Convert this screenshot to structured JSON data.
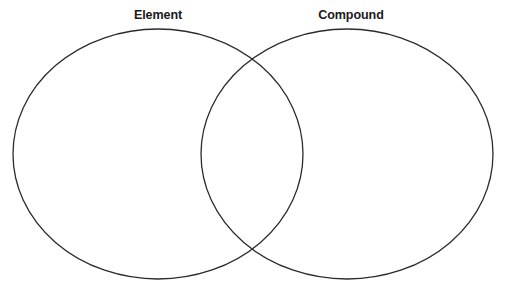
{
  "diagram": {
    "type": "venn-diagram",
    "title": "",
    "background_color": "#ffffff",
    "stroke_color": "#2b2b2b",
    "stroke_width": 1.3,
    "fill": "none",
    "sets": [
      {
        "id": "left",
        "label": "Element",
        "shape": "ellipse",
        "cx": 158,
        "cy": 154,
        "rx": 145,
        "ry": 125
      },
      {
        "id": "right",
        "label": "Compound",
        "shape": "ellipse",
        "cx": 347,
        "cy": 154,
        "rx": 146,
        "ry": 125
      }
    ],
    "intersection": {
      "label": "",
      "upper_point": [
        255,
        63
      ],
      "lower_point": [
        256,
        255
      ]
    },
    "regions": {
      "left_only_text": "",
      "overlap_text": "",
      "right_only_text": ""
    }
  },
  "labels": {
    "left": "Element",
    "right": "Compound"
  }
}
